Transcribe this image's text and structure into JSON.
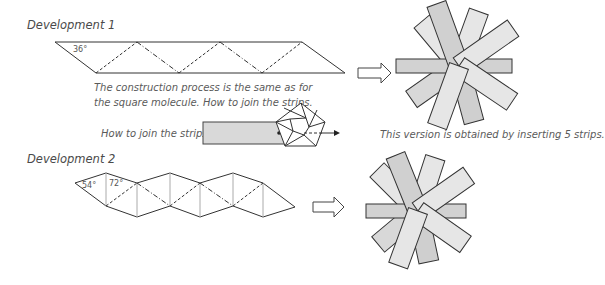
{
  "development1": {
    "title": "Development 1",
    "angle_label": "36°",
    "caption_line1": "The construction process is the same as for",
    "caption_line2": "the square molecule. How to join the strips."
  },
  "join": {
    "label": "How to join the strips."
  },
  "result1": {
    "caption": "This version is obtained by inserting 5 strips."
  },
  "development2": {
    "title": "Development 2",
    "angle_label_1": "54°",
    "angle_label_2": "72°"
  },
  "colors": {
    "line": "#333333",
    "strip_light": "#e6e6e6",
    "strip_mid": "#cfcfcf",
    "fold_gray": "#aaaaaa"
  }
}
